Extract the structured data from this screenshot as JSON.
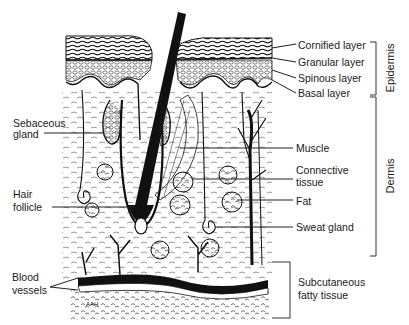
{
  "diagram": {
    "right_labels": [
      {
        "id": "cornified",
        "text": "Cornified layer"
      },
      {
        "id": "granular",
        "text": "Granular layer"
      },
      {
        "id": "spinous",
        "text": "Spinous layer"
      },
      {
        "id": "basal",
        "text": "Basal layer"
      },
      {
        "id": "muscle",
        "text": "Muscle"
      },
      {
        "id": "connective1",
        "text": "Connective"
      },
      {
        "id": "connective2",
        "text": "tissue"
      },
      {
        "id": "fat",
        "text": "Fat"
      },
      {
        "id": "sweat",
        "text": "Sweat gland"
      },
      {
        "id": "subcut1",
        "text": "Subcutaneous"
      },
      {
        "id": "subcut2",
        "text": "fatty tissue"
      }
    ],
    "left_labels": [
      {
        "id": "sebaceous1",
        "text": "Sebaceous"
      },
      {
        "id": "sebaceous2",
        "text": "gland"
      },
      {
        "id": "hair1",
        "text": "Hair"
      },
      {
        "id": "hair2",
        "text": "follicle"
      },
      {
        "id": "blood1",
        "text": "Blood"
      },
      {
        "id": "blood2",
        "text": "vessels"
      }
    ],
    "brackets": [
      {
        "id": "epidermis",
        "text": "Epidermis"
      },
      {
        "id": "dermis",
        "text": "Dermis"
      }
    ],
    "signature": "AAH",
    "colors": {
      "ink": "#111111",
      "background": "#ffffff"
    }
  }
}
